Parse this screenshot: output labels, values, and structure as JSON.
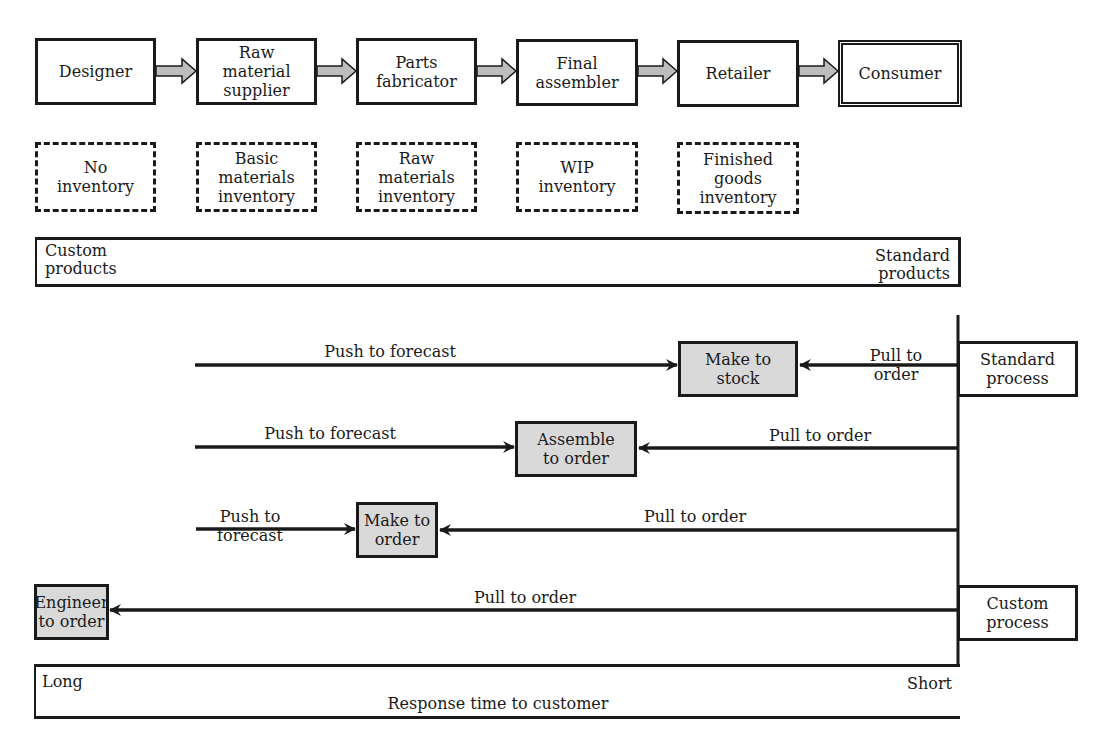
{
  "supply_chain": {
    "stages": [
      {
        "label": "Designer"
      },
      {
        "label": "Raw\nmaterial\nsupplier"
      },
      {
        "label": "Parts\nfabricator"
      },
      {
        "label": "Final\nassembler"
      },
      {
        "label": "Retailer"
      },
      {
        "label": "Consumer"
      }
    ],
    "inventories": [
      {
        "label": "No\ninventory"
      },
      {
        "label": "Basic\nmaterials\ninventory"
      },
      {
        "label": "Raw\nmaterials\ninventory"
      },
      {
        "label": "WIP\ninventory"
      },
      {
        "label": "Finished\ngoods\ninventory"
      }
    ]
  },
  "product_band": {
    "left_label": "Custom\nproducts",
    "right_label": "Standard\nproducts"
  },
  "process_labels": {
    "standard": "Standard\nprocess",
    "custom": "Custom\nprocess"
  },
  "strategies": [
    {
      "name": "Make to\nstock",
      "push_label": "Push to forecast",
      "pull_label": "Pull to\norder"
    },
    {
      "name": "Assemble\nto order",
      "push_label": "Push to forecast",
      "pull_label": "Pull to order"
    },
    {
      "name": "Make to\norder",
      "push_label": "Push to\nforecast",
      "pull_label": "Pull to order"
    },
    {
      "name": "Engineer\nto order",
      "push_label": "",
      "pull_label": "Pull to order"
    }
  ],
  "response_band": {
    "left_label": "Long",
    "right_label": "Short",
    "caption": "Response time to customer"
  },
  "colors": {
    "line": "#1a1a1a",
    "shaded_box": "#d9d9d9",
    "arrow_fill": "#bdbdbd"
  }
}
